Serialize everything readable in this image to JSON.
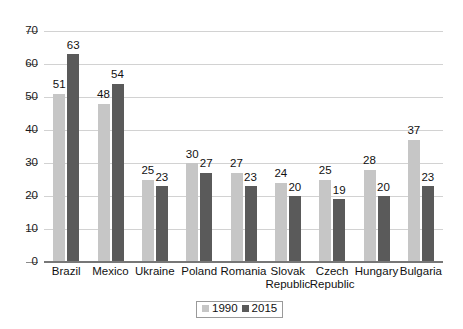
{
  "chart_data": {
    "type": "bar",
    "title": "",
    "subtitle": "",
    "xlabel": "",
    "ylabel": "",
    "ylim": [
      0,
      70
    ],
    "ytick_step": 10,
    "yticks": [
      "0",
      "10",
      "20",
      "30",
      "40",
      "50",
      "60",
      "70"
    ],
    "grid": true,
    "legend_position": "bottom-center",
    "categories": [
      "Brazil",
      "Mexico",
      "Ukraine",
      "Poland",
      "Romania",
      "Slovak\nRepublic",
      "Czech\nRepublic",
      "Hungary",
      "Bulgaria"
    ],
    "series": [
      {
        "name": "1990",
        "color": "#c6c6c6",
        "values": [
          51,
          48,
          25,
          30,
          27,
          24,
          25,
          28,
          37
        ]
      },
      {
        "name": "2015",
        "color": "#5a5a5a",
        "values": [
          63,
          54,
          23,
          27,
          23,
          20,
          19,
          20,
          23
        ]
      }
    ]
  },
  "legend": {
    "items": [
      {
        "label": "1990",
        "color": "#c6c6c6"
      },
      {
        "label": "2015",
        "color": "#5a5a5a"
      }
    ]
  },
  "colors": {
    "background": "#ffffff",
    "gridline": "#d2d2d2",
    "axis": "#777777",
    "text": "#111111",
    "series_1990": "#c6c6c6",
    "series_2015": "#5a5a5a"
  }
}
